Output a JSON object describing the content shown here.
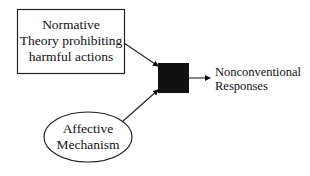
{
  "diagram": {
    "nodes": [
      {
        "id": "normative",
        "shape": "rectangle",
        "lines": [
          "Normative",
          "Theory prohibiting",
          "harmful actions"
        ]
      },
      {
        "id": "affective",
        "shape": "ellipse",
        "lines": [
          "Affective",
          "Mechanism"
        ]
      },
      {
        "id": "junction",
        "shape": "filled-square",
        "color": "#111111"
      }
    ],
    "output": {
      "lines": [
        "Nonconventional",
        "Responses"
      ]
    },
    "edges": [
      {
        "from": "normative",
        "to": "junction"
      },
      {
        "from": "affective",
        "to": "junction"
      },
      {
        "from": "junction",
        "to": "output"
      }
    ]
  }
}
